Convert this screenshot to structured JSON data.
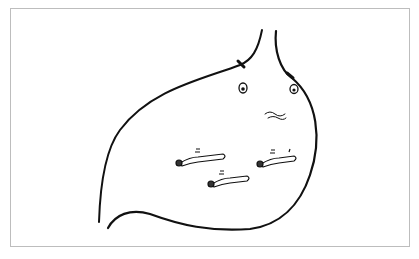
{
  "illustration": {
    "subject": "stomach with worms",
    "colors": {
      "stroke": "#111111",
      "frame": "#bdbdbd",
      "background": "#ffffff"
    }
  }
}
